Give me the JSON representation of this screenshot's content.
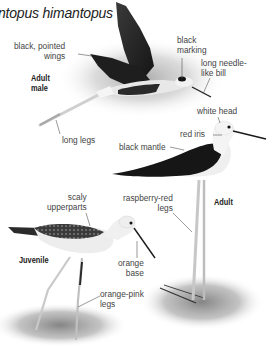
{
  "title": "ntopus himantopus",
  "figures": {
    "adult_male": {
      "tag": [
        "Adult",
        "male"
      ],
      "labels": {
        "wings": [
          "black, pointed",
          "wings"
        ],
        "marking": [
          "black",
          "marking"
        ],
        "bill": [
          "long needle-",
          "like bill"
        ],
        "legs": [
          "long legs"
        ]
      }
    },
    "adult": {
      "tag": [
        "Adult"
      ],
      "labels": {
        "head": [
          "white head"
        ],
        "iris": [
          "red iris"
        ],
        "mantle": [
          "black mantle"
        ],
        "legs": [
          "raspberry-red",
          "legs"
        ]
      }
    },
    "juvenile": {
      "tag": [
        "Juvenile"
      ],
      "labels": {
        "upperparts": [
          "scaly",
          "upperparts"
        ],
        "base": [
          "orange",
          "base"
        ],
        "legs": [
          "orange-pink",
          "legs"
        ]
      }
    }
  },
  "colors": {
    "background": "#ffffff",
    "text": "#444444",
    "bird_black": "#1c1c1c",
    "bird_white": "#f1f1f1",
    "leg": "#c9c9c9",
    "shadow": "#9a9a9a"
  }
}
